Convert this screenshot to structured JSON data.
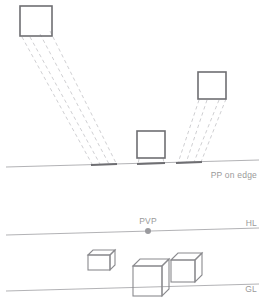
{
  "diagram": {
    "colors": {
      "square_outline": "#6e6e72",
      "cube_outline": "#8a8a8e",
      "ray_dashed": "#c3c3c7",
      "reference_line": "#a9a9ad",
      "trace_segment": "#6e6e72",
      "label_text": "#9a9a9a",
      "vanishing_point": "#9a9a9e",
      "background": "#ffffff"
    },
    "labels": {
      "pp": "PP on edge",
      "pvp": "PVP",
      "hl": "HL",
      "gl": "GL"
    },
    "plan_view": {
      "squares": [
        {
          "name": "left-square",
          "x": 20,
          "y": 6,
          "width": 32,
          "height": 30
        },
        {
          "name": "center-square",
          "x": 137,
          "y": 131,
          "width": 28,
          "height": 27
        },
        {
          "name": "right-square",
          "x": 198,
          "y": 72,
          "width": 28,
          "height": 27
        }
      ],
      "picture_plane_line": {
        "x1": 6,
        "y1": 167,
        "x2": 259,
        "y2": 160
      },
      "trace_segments": [
        {
          "name": "left-trace",
          "x1": 91,
          "y1": 165,
          "x2": 117,
          "y2": 164
        },
        {
          "name": "center-trace",
          "x1": 137,
          "y1": 164,
          "x2": 165,
          "y2": 163
        },
        {
          "name": "right-trace",
          "x1": 176,
          "y1": 163,
          "x2": 202,
          "y2": 162
        }
      ],
      "ray_bundles": [
        {
          "name": "left-ray-bundle",
          "rays": [
            {
              "x1": 22,
              "y1": 37,
              "x2": 92,
              "y2": 164
            },
            {
              "x1": 30,
              "y1": 37,
              "x2": 100,
              "y2": 164
            },
            {
              "x1": 40,
              "y1": 34,
              "x2": 109,
              "y2": 164
            },
            {
              "x1": 50,
              "y1": 31,
              "x2": 116,
              "y2": 163
            }
          ]
        },
        {
          "name": "center-ray-drops",
          "rays": [
            {
              "x1": 139,
              "y1": 159,
              "x2": 138,
              "y2": 164
            },
            {
              "x1": 163,
              "y1": 158,
              "x2": 164,
              "y2": 163
            }
          ]
        },
        {
          "name": "right-ray-bundle",
          "rays": [
            {
              "x1": 199,
              "y1": 100,
              "x2": 178,
              "y2": 163
            },
            {
              "x1": 207,
              "y1": 100,
              "x2": 186,
              "y2": 163
            },
            {
              "x1": 219,
              "y1": 100,
              "x2": 194,
              "y2": 162
            },
            {
              "x1": 226,
              "y1": 99,
              "x2": 201,
              "y2": 162
            }
          ]
        }
      ]
    },
    "perspective_view": {
      "horizon_line": {
        "x1": 6,
        "y1": 235,
        "x2": 259,
        "y2": 228
      },
      "ground_line": {
        "x1": 6,
        "y1": 291,
        "x2": 259,
        "y2": 284
      },
      "vanishing_point": {
        "x": 148,
        "y": 231,
        "radius": 3
      },
      "cubes": [
        {
          "name": "left-cube",
          "x": 88,
          "y": 250,
          "width": 22,
          "height": 15,
          "depth": 5
        },
        {
          "name": "center-cube",
          "x": 133,
          "y": 259,
          "width": 29,
          "height": 30,
          "depth": 7
        },
        {
          "name": "right-cube",
          "x": 171,
          "y": 253,
          "width": 24,
          "height": 22,
          "depth": 7
        }
      ]
    }
  }
}
